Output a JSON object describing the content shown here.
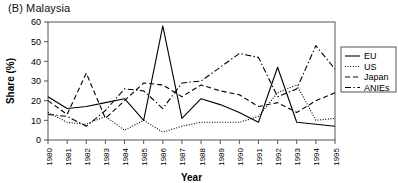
{
  "panel": {
    "title": "(B) Malaysia"
  },
  "axes": {
    "ylabel": "Share (%)",
    "xlabel": "Year",
    "yticks": [
      "0",
      "10",
      "20",
      "30",
      "40",
      "50",
      "60"
    ],
    "ylim": [
      0,
      60
    ]
  },
  "legend": {
    "position": "right",
    "entries": [
      {
        "label": "EU",
        "style": "solid"
      },
      {
        "label": "US",
        "style": "dotted"
      },
      {
        "label": "Japan",
        "style": "dashed"
      },
      {
        "label": "ANIEs",
        "style": "dash-dot"
      }
    ]
  },
  "colors": {
    "ink": "#000000",
    "frame": "#555555",
    "background": "#ffffff"
  },
  "chart_data": {
    "type": "line",
    "title": "(B) Malaysia",
    "xlabel": "Year",
    "ylabel": "Share (%)",
    "ylim": [
      0,
      60
    ],
    "grid": false,
    "legend_position": "right",
    "categories": [
      "1980",
      "1981",
      "1982",
      "1983",
      "1984",
      "1985",
      "1986",
      "1987",
      "1988",
      "1989",
      "1990",
      "1991",
      "1992",
      "1993",
      "1994",
      "1995"
    ],
    "series": [
      {
        "name": "EU",
        "style": "solid",
        "values": [
          22,
          16,
          17,
          19,
          21,
          10,
          58,
          11,
          21,
          18,
          14,
          9,
          37,
          9,
          8,
          7
        ]
      },
      {
        "name": "US",
        "style": "dotted",
        "values": [
          14,
          9,
          8,
          12,
          5,
          10,
          4,
          7,
          9,
          9,
          9,
          12,
          24,
          28,
          10,
          11
        ]
      },
      {
        "name": "Japan",
        "style": "dashed",
        "values": [
          20,
          13,
          34,
          11,
          20,
          29,
          28,
          22,
          28,
          25,
          23,
          17,
          19,
          14,
          20,
          24
        ]
      },
      {
        "name": "ANIEs",
        "style": "dash-dot",
        "values": [
          13,
          12,
          7,
          15,
          26,
          25,
          16,
          29,
          30,
          37,
          44,
          42,
          22,
          26,
          48,
          36
        ]
      }
    ]
  }
}
